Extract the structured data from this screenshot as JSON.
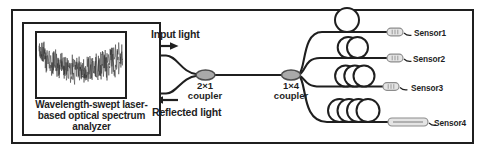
{
  "analyzer": {
    "label_lines": [
      "Wavelength-swept laser-",
      "based optical spectrum",
      "analyzer"
    ]
  },
  "signals": {
    "input": "Input light",
    "reflected": "Reflected light"
  },
  "couplers": [
    {
      "ratio": "2×1",
      "word": "coupler"
    },
    {
      "ratio": "1×4",
      "word": "coupler"
    }
  ],
  "sensors": [
    {
      "label": "Sensor1",
      "loops": 1
    },
    {
      "label": "Sensor2",
      "loops": 2
    },
    {
      "label": "Sensor3",
      "loops": 3
    },
    {
      "label": "Sensor4",
      "loops": 4
    }
  ],
  "colors": {
    "line": "#1f1f1f",
    "coupler_fill": "#a9a9a9",
    "coupler_stroke": "#4d4d4d",
    "sensor_fill": "#e4e4e4",
    "sensor_stroke": "#8c8c8c",
    "sensor_detail": "#9a9a9a",
    "trace": "#2e2e2e",
    "background": "#ffffff"
  }
}
